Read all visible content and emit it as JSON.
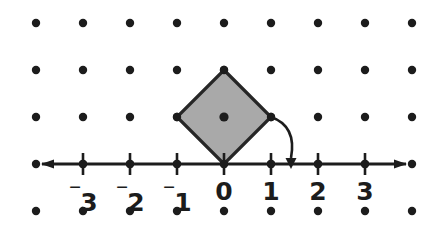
{
  "figure": {
    "width": 439,
    "height": 228,
    "background_color": "#ffffff"
  },
  "colors": {
    "ink": "#1c1c1c",
    "shape_fill": "#a9a9a9",
    "shape_stroke": "#262626",
    "background": "#ffffff"
  },
  "grid": {
    "name": "lattice-dot-grid",
    "columns": 9,
    "rows": 4,
    "spacing_px": 47,
    "x_positions": [
      36,
      83,
      130,
      177,
      224,
      271,
      318,
      365,
      412
    ],
    "y_positions": [
      23,
      70,
      117,
      164,
      211
    ],
    "dot_radius": 4.2
  },
  "number_line": {
    "name": "horizontal-number-line",
    "y": 164,
    "x_start": 36,
    "x_end": 412,
    "left_arrow": "left-arrowhead",
    "right_arrow": "right-arrowhead",
    "tick_height": 11,
    "ticks": [
      {
        "value": "-3",
        "display_sign": "⁻",
        "display_digit": "3",
        "x": 83
      },
      {
        "value": "-2",
        "display_sign": "⁻",
        "display_digit": "2",
        "x": 130
      },
      {
        "value": "-1",
        "display_sign": "⁻",
        "display_digit": "1",
        "x": 177
      },
      {
        "value": "0",
        "display_sign": "",
        "display_digit": "0",
        "x": 224
      },
      {
        "value": "1",
        "display_sign": "",
        "display_digit": "1",
        "x": 271
      },
      {
        "value": "2",
        "display_sign": "",
        "display_digit": "2",
        "x": 318
      },
      {
        "value": "3",
        "display_sign": "",
        "display_digit": "3",
        "x": 365
      }
    ],
    "label_top_y": 179
  },
  "shape": {
    "name": "shaded-square-diamond",
    "kind": "square rotated 45 degrees (diamond)",
    "fill": "#a9a9a9",
    "vertices": [
      {
        "name": "top-vertex",
        "x": 224,
        "y": 70
      },
      {
        "name": "right-vertex",
        "x": 271,
        "y": 117
      },
      {
        "name": "bottom-vertex",
        "x": 224,
        "y": 164
      },
      {
        "name": "left-vertex",
        "x": 177,
        "y": 117
      }
    ],
    "vertex_dots": [
      {
        "name": "vertex-dot-top",
        "x": 224,
        "y": 70
      },
      {
        "name": "vertex-dot-right",
        "x": 271,
        "y": 117
      },
      {
        "name": "vertex-dot-left",
        "x": 177,
        "y": 117
      }
    ],
    "center_dot": {
      "name": "shape-center-dot",
      "x": 224,
      "y": 117,
      "radius": 4.6
    }
  },
  "rotation_arrow": {
    "name": "rotation-arc-arrow",
    "from": {
      "x": 271,
      "y": 117
    },
    "to": {
      "x": 291,
      "y": 158
    },
    "control": {
      "x": 297,
      "y": 126
    },
    "description": "curved arrow from the right vertex of the square down to the number line between 1 and 2"
  }
}
